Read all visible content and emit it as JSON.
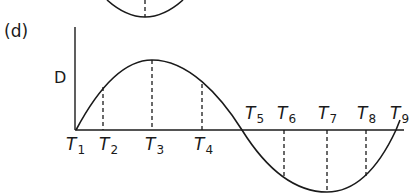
{
  "panel_label": "(d)",
  "y_axis_label": "D",
  "ticks": [
    {
      "letter": "T",
      "sub": "1"
    },
    {
      "letter": "T",
      "sub": "2"
    },
    {
      "letter": "T",
      "sub": "3"
    },
    {
      "letter": "T",
      "sub": "4"
    },
    {
      "letter": "T",
      "sub": "5"
    },
    {
      "letter": "T",
      "sub": "6"
    },
    {
      "letter": "T",
      "sub": "7"
    },
    {
      "letter": "T",
      "sub": "8"
    },
    {
      "letter": "T",
      "sub": "9"
    }
  ],
  "colors": {
    "line": "#1a1a1a",
    "background": "#ffffff"
  }
}
